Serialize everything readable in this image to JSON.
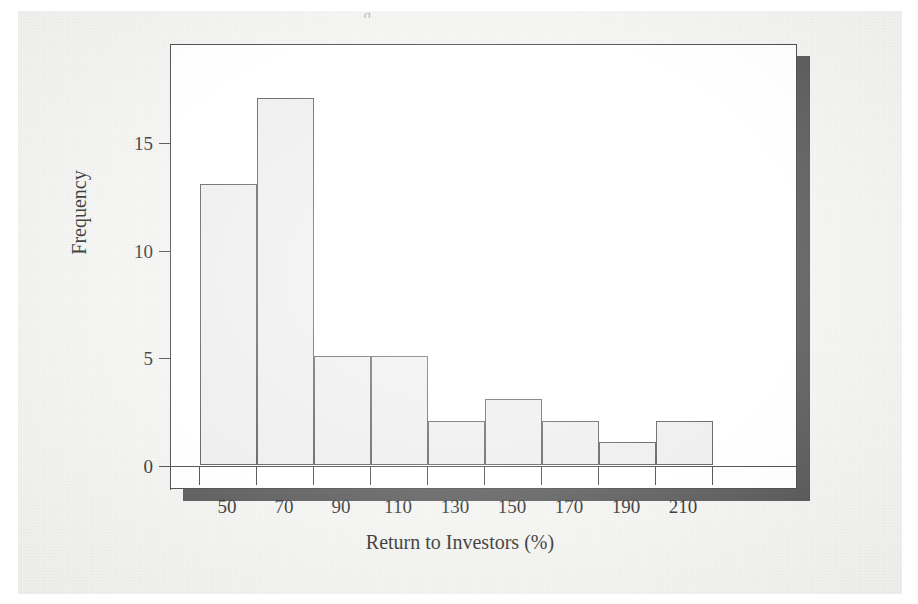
{
  "figure": {
    "caption_remnant": "g",
    "background_color": "#f4f4f2",
    "panel_color": "#ffffff",
    "shadow_color": "#4a4a4a",
    "bar_fill_color": "#ececec",
    "bar_edge_color": "#4d4d4d",
    "axis_color": "#3a3a3a"
  },
  "chart_data": {
    "type": "bar",
    "title": "",
    "subtitle": "",
    "xlabel": "Return to Investors (%)",
    "ylabel": "Frequency",
    "categories": [
      "50",
      "70",
      "90",
      "110",
      "130",
      "150",
      "170",
      "190",
      "210"
    ],
    "values": [
      13,
      17,
      5,
      5,
      2,
      3,
      2,
      1,
      2
    ],
    "bin_edges": [
      40,
      60,
      80,
      100,
      120,
      140,
      160,
      180,
      200,
      220
    ],
    "bin_width": 20,
    "xlim": [
      30,
      250
    ],
    "ylim": [
      0,
      18
    ],
    "x_tick_labels": [
      "50",
      "70",
      "90",
      "110",
      "130",
      "150",
      "170",
      "190",
      "210"
    ],
    "y_tick_labels": [
      "0",
      "5",
      "10",
      "15"
    ],
    "y_tick_values": [
      0,
      5,
      10,
      15
    ],
    "grid": false,
    "legend": "none"
  }
}
